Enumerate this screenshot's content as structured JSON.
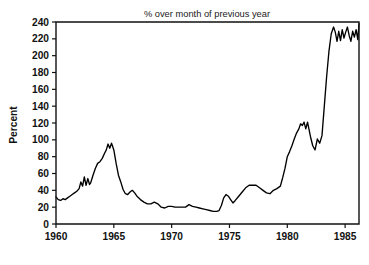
{
  "chart_data": {
    "type": "line",
    "title": "% over month of previous year",
    "xlabel": "",
    "ylabel": "Percent",
    "xlim": [
      1960.0,
      1986.2
    ],
    "ylim": [
      0,
      240
    ],
    "xticks": [
      1960,
      1965,
      1970,
      1975,
      1980,
      1985
    ],
    "xtick_labels": [
      "1960",
      "1965",
      "1970",
      "1975",
      "1980",
      "1985"
    ],
    "yticks": [
      0,
      20,
      40,
      60,
      80,
      100,
      120,
      140,
      160,
      180,
      200,
      220,
      240
    ],
    "ytick_labels": [
      "0",
      "20",
      "40",
      "60",
      "80",
      "100",
      "120",
      "140",
      "160",
      "180",
      "200",
      "220",
      "240"
    ],
    "grid": false,
    "legend": false,
    "line_color": "#000000",
    "series": [
      {
        "name": "% over month of previous year",
        "x": [
          1960.0,
          1960.2,
          1960.4,
          1960.6,
          1960.8,
          1961.0,
          1961.2,
          1961.4,
          1961.6,
          1961.8,
          1962.0,
          1962.15,
          1962.3,
          1962.45,
          1962.6,
          1962.75,
          1962.9,
          1963.0,
          1963.2,
          1963.4,
          1963.6,
          1963.8,
          1964.0,
          1964.2,
          1964.35,
          1964.5,
          1964.65,
          1964.8,
          1964.9,
          1965.0,
          1965.2,
          1965.4,
          1965.6,
          1965.8,
          1966.0,
          1966.2,
          1966.4,
          1966.6,
          1966.8,
          1967.0,
          1967.3,
          1967.6,
          1967.9,
          1968.2,
          1968.5,
          1968.8,
          1969.1,
          1969.4,
          1969.7,
          1970.0,
          1970.3,
          1970.6,
          1970.9,
          1971.2,
          1971.5,
          1971.8,
          1972.1,
          1972.4,
          1972.7,
          1973.0,
          1973.3,
          1973.6,
          1973.9,
          1974.1,
          1974.3,
          1974.5,
          1974.7,
          1974.9,
          1975.1,
          1975.3,
          1975.5,
          1975.8,
          1976.1,
          1976.4,
          1976.7,
          1977.0,
          1977.3,
          1977.6,
          1977.9,
          1978.2,
          1978.5,
          1978.8,
          1979.1,
          1979.4,
          1979.6,
          1979.8,
          1980.0,
          1980.2,
          1980.4,
          1980.6,
          1980.8,
          1981.0,
          1981.15,
          1981.3,
          1981.45,
          1981.6,
          1981.75,
          1982.0,
          1982.2,
          1982.4,
          1982.6,
          1982.8,
          1983.0,
          1983.2,
          1983.4,
          1983.6,
          1983.8,
          1984.0,
          1984.15,
          1984.3,
          1984.45,
          1984.6,
          1984.75,
          1984.9,
          1985.05,
          1985.2,
          1985.35,
          1985.5,
          1985.65,
          1985.8,
          1985.95,
          1986.1,
          1986.2
        ],
        "values": [
          32,
          29,
          28,
          30,
          29,
          31,
          33,
          35,
          37,
          39,
          42,
          50,
          45,
          56,
          46,
          54,
          47,
          49,
          58,
          66,
          72,
          74,
          78,
          84,
          88,
          95,
          90,
          96,
          92,
          88,
          72,
          58,
          50,
          41,
          36,
          35,
          38,
          40,
          37,
          33,
          29,
          26,
          24,
          24,
          26,
          24,
          20,
          19,
          21,
          21,
          20,
          20,
          20,
          20,
          23,
          21,
          20,
          19,
          18,
          17,
          16,
          15,
          15,
          16,
          22,
          31,
          35,
          33,
          29,
          25,
          28,
          33,
          38,
          43,
          46,
          46,
          46,
          43,
          40,
          37,
          36,
          40,
          42,
          45,
          55,
          66,
          80,
          86,
          93,
          101,
          108,
          113,
          119,
          117,
          121,
          113,
          121,
          104,
          93,
          88,
          101,
          96,
          105,
          140,
          175,
          205,
          226,
          234,
          228,
          217,
          229,
          218,
          231,
          221,
          228,
          234,
          224,
          217,
          229,
          222,
          231,
          219,
          238
        ]
      }
    ]
  },
  "axes": {
    "ylabel_text": "Percent"
  }
}
